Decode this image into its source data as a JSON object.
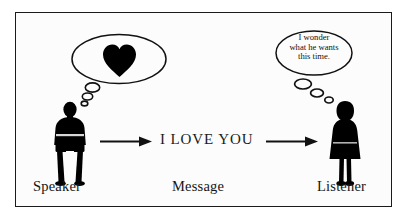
{
  "figure": {
    "background_color": "#fcfcfc",
    "border_color": "#1a1a1a",
    "ink_color": "#000000"
  },
  "labels": {
    "speaker": "Speaker",
    "message": "Message",
    "listener": "Listener"
  },
  "message": {
    "text": "I LOVE YOU"
  },
  "speaker_thought": {
    "icon": "heart-icon",
    "content_type": "heart",
    "bubble_shape": "ellipse",
    "trailing_bubble_count": 3
  },
  "listener_thought": {
    "bubble_shape": "ellipse",
    "trailing_bubble_count": 3,
    "lines": [
      "I wonder",
      "what he wants",
      "this time."
    ]
  },
  "arrows": {
    "left": {
      "direction": "right",
      "from": "speaker",
      "to": "message"
    },
    "right": {
      "direction": "right",
      "from": "message",
      "to": "listener"
    }
  },
  "figures": {
    "speaker": {
      "silhouette": "male-standing-arms-folded",
      "fill": "#000000"
    },
    "listener": {
      "silhouette": "female-standing-dress",
      "fill": "#000000"
    }
  }
}
